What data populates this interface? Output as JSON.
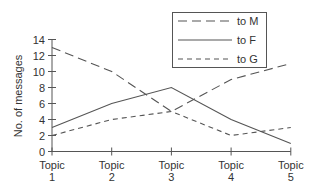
{
  "chart_data": {
    "type": "line",
    "title": "",
    "xlabel": "",
    "ylabel": "No. of messages",
    "categories": [
      [
        "Topic",
        "1"
      ],
      [
        "Topic",
        "2"
      ],
      [
        "Topic",
        "3"
      ],
      [
        "Topic",
        "4"
      ],
      [
        "Topic",
        "5"
      ]
    ],
    "yticks": [
      "0",
      "2",
      "4",
      "6",
      "8",
      "10",
      "12",
      "14"
    ],
    "ylim": [
      0,
      14
    ],
    "grid": false,
    "legend_position": "top-right",
    "series": [
      {
        "name": "to M",
        "style": "long-dash",
        "values": [
          13,
          10,
          5,
          9,
          11
        ]
      },
      {
        "name": "to F",
        "style": "solid",
        "values": [
          3,
          6,
          8,
          4,
          1
        ]
      },
      {
        "name": "to G",
        "style": "short-dash",
        "values": [
          2,
          4,
          5,
          2,
          3
        ]
      }
    ]
  }
}
